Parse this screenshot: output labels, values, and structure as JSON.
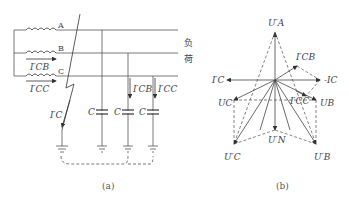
{
  "diagram_a": {
    "caption": "(a)",
    "phase_labels": [
      "A",
      "B",
      "C"
    ],
    "load_label_top": "负",
    "load_label_bottom": "荷",
    "current_labels": {
      "icb_source": "I′CB",
      "icc_source": "I′CC",
      "ic_fault": "I′C",
      "icb_cap": "I′CB",
      "icc_cap": "I′CC"
    },
    "capacitor_label": "C"
  },
  "diagram_b": {
    "caption": "(b)",
    "phasor_labels": {
      "ua_prime": "U′A",
      "icb_prime": "I′CB",
      "ic_prime": "I′C",
      "neg_ic": "-IC",
      "uc": "UC",
      "icc_prime": "I′CC",
      "ub": "UB",
      "un_prime": "U′N",
      "uc_prime": "U′C",
      "ub_prime": "U′B"
    }
  }
}
